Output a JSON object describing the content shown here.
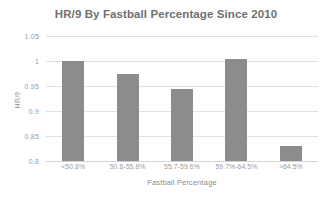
{
  "chart_data": {
    "type": "bar",
    "title": "HR/9 By Fastball Percentage Since 2010",
    "xlabel": "Fastball Percentage",
    "ylabel": "HR/9",
    "categories": [
      "<50.8%",
      "50.8-55.6%",
      "55.7-59.6%",
      "59.7%-64.5%",
      ">64.5%"
    ],
    "values": [
      1.0,
      0.975,
      0.945,
      1.005,
      0.83
    ],
    "ylim": [
      0.8,
      1.05
    ],
    "ytick_labels": [
      "1.05",
      "1",
      "0.95",
      "0.9",
      "0.85",
      "0.8"
    ],
    "ytick_values": [
      1.05,
      1.0,
      0.95,
      0.9,
      0.85,
      0.8
    ],
    "grid": true,
    "legend": "none",
    "series": [
      {
        "name": "HR/9",
        "values": [
          1.0,
          0.975,
          0.945,
          1.005,
          0.83
        ]
      }
    ],
    "colors": {
      "bar": "#8c8c8c",
      "gridline": "#e2e2e2",
      "title_text": "#707070",
      "tick_text": "#9a9a9a",
      "background": "#ffffff"
    }
  }
}
